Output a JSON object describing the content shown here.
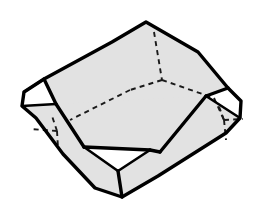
{
  "figure": {
    "title": "Truncated rectangular prism crystal form",
    "solid_name": "truncated-cuboid",
    "width": 256,
    "height": 214
  },
  "style": {
    "background_color": "#ffffff",
    "face_fill_shaded": "#e2e2e2",
    "face_fill_white": "#ffffff",
    "edge_color": "#000000",
    "hidden_edge_color": "#1a1a1a",
    "edge_width": 3.4,
    "hidden_edge_width": 1.9,
    "hidden_edge_dash": "5 4.2"
  },
  "geometry": {
    "vertices": {
      "top_apex": [
        146,
        22
      ],
      "top_left_a": [
        112,
        42
      ],
      "top_left_b": [
        44,
        79
      ],
      "left_upper": [
        24,
        92
      ],
      "left_point": [
        22,
        106
      ],
      "left_lower_a": [
        36,
        118
      ],
      "bottom_left": [
        63,
        154
      ],
      "bottom_apex_l": [
        95,
        188
      ],
      "bottom_apex": [
        122,
        197
      ],
      "bottom_right_a": [
        158,
        176
      ],
      "right_lower": [
        226,
        133
      ],
      "right_point": [
        240,
        118
      ],
      "right_upper_b": [
        241,
        101
      ],
      "right_upper_a": [
        228,
        88
      ],
      "top_right_a": [
        198,
        52
      ],
      "face_tl": [
        64,
        86
      ],
      "face_tr": [
        208,
        94
      ],
      "face_bl": [
        82,
        131
      ],
      "face_br": [
        160,
        152
      ],
      "tri_left_in": [
        56,
        104
      ],
      "tri_right_in": [
        206,
        96
      ],
      "tri_front_l": [
        84,
        147
      ],
      "tri_front_r": [
        150,
        150
      ],
      "tri_front_p": [
        118,
        171
      ],
      "hid_top_c": [
        162,
        80
      ],
      "hid_top_u": [
        154,
        32
      ],
      "hid_top_l": [
        130,
        90
      ],
      "hid_top_r": [
        214,
        98
      ],
      "hid_back_l": [
        70,
        120
      ],
      "hid_left_c": [
        57,
        131
      ],
      "hid_left_u": [
        52,
        116
      ],
      "hid_left_d": [
        58,
        146
      ],
      "hid_left_w": [
        30,
        129
      ],
      "hid_right_c": [
        224,
        120
      ],
      "hid_right_u": [
        218,
        104
      ],
      "hid_right_d": [
        226,
        140
      ],
      "hid_right_e": [
        243,
        119
      ]
    },
    "faces": [
      {
        "id": "face-top",
        "label": "top face",
        "fill": "shaded"
      },
      {
        "id": "face-front-left",
        "label": "front-left face",
        "fill": "shaded"
      },
      {
        "id": "face-front-right",
        "label": "front-right face",
        "fill": "shaded"
      },
      {
        "id": "facet-left",
        "label": "left corner truncation",
        "fill": "white"
      },
      {
        "id": "facet-right",
        "label": "right corner truncation",
        "fill": "white"
      },
      {
        "id": "facet-front",
        "label": "front corner truncation",
        "fill": "white"
      }
    ],
    "hidden_edge_count": 8,
    "visible_edge_count": 18
  }
}
